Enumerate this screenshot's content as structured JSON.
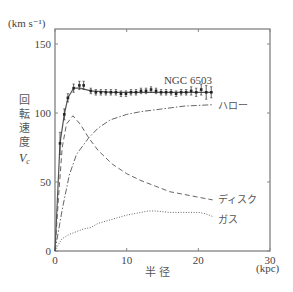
{
  "chart_data": {
    "type": "line",
    "title": "",
    "galaxy_label": "NGC 6503",
    "xlabel": "半 径",
    "xunit": "(kpc)",
    "ylabel": "回転速度",
    "ylabel_symbol": "V",
    "ylabel_subscript": "c",
    "yunit": "(km s⁻¹)",
    "xlim": [
      0,
      30
    ],
    "ylim": [
      0,
      160
    ],
    "xticks": [
      0,
      10,
      20,
      30
    ],
    "yticks": [
      0,
      50,
      100,
      150
    ],
    "grid": false,
    "legend_position": "inline-right",
    "series": [
      {
        "name": "NGC 6503",
        "style": "observed-points-with-errorbars",
        "x": [
          0.7,
          1.3,
          1.8,
          2.6,
          3.4,
          4.0,
          5.0,
          5.7,
          6.4,
          7.1,
          7.8,
          8.5,
          9.2,
          9.9,
          10.6,
          11.3,
          12.0,
          12.7,
          13.4,
          14.1,
          14.8,
          15.5,
          16.2,
          16.9,
          17.6,
          18.3,
          19.0,
          19.7,
          20.4,
          21.1,
          21.8
        ],
        "y": [
          78,
          99,
          111,
          118,
          120,
          120,
          116,
          115,
          115,
          115,
          115,
          115,
          114,
          114,
          115,
          115,
          116,
          116,
          117,
          116,
          115,
          115,
          115,
          114,
          115,
          115,
          116,
          115,
          117,
          115,
          115
        ],
        "err": [
          8,
          4,
          3,
          3,
          3,
          3,
          2,
          2,
          2,
          2,
          2,
          2,
          2,
          2,
          2,
          2,
          2,
          2,
          2,
          2,
          2,
          2,
          2,
          2,
          2,
          2,
          3,
          3,
          4,
          5,
          4
        ]
      },
      {
        "name": "fit",
        "style": "solid",
        "x": [
          0,
          0.7,
          1.3,
          1.8,
          2.6,
          3.5,
          5,
          8,
          12,
          16,
          20,
          22
        ],
        "y": [
          0,
          78,
          99,
          111,
          118,
          118,
          116,
          115,
          115,
          115,
          115,
          115
        ]
      },
      {
        "name": "ハロー",
        "style": "dash-dot",
        "x": [
          0,
          1,
          2,
          3,
          4.7,
          6,
          7.7,
          10,
          12,
          15,
          18,
          22
        ],
        "y": [
          0,
          30,
          55,
          70,
          82,
          89,
          95,
          99,
          101,
          103,
          105,
          106
        ]
      },
      {
        "name": "ディスク",
        "style": "dashed",
        "x": [
          0,
          0.5,
          1,
          1.6,
          2.5,
          3.5,
          4.7,
          6,
          8,
          10,
          12,
          14,
          16,
          18,
          20,
          22
        ],
        "y": [
          0,
          40,
          75,
          92,
          98,
          92,
          82,
          73,
          63,
          56,
          51,
          47,
          43,
          41,
          39,
          37
        ]
      },
      {
        "name": "ガス",
        "style": "dotted",
        "x": [
          0,
          0.5,
          1,
          2,
          4,
          5,
          6,
          8,
          10,
          12,
          13,
          14,
          16,
          18,
          20,
          21,
          22
        ],
        "y": [
          0,
          5,
          9,
          12,
          16,
          17,
          20,
          23,
          26,
          28,
          29,
          29,
          28,
          28,
          28,
          27,
          25
        ]
      }
    ],
    "annotations": [
      {
        "text": "NGC 6503",
        "x": 15.2,
        "y": 124
      },
      {
        "text": "ハロー",
        "x": 22.8,
        "y": 106
      },
      {
        "text": "ディスク",
        "x": 22.8,
        "y": 38
      },
      {
        "text": "ガス",
        "x": 22.8,
        "y": 23
      }
    ]
  }
}
